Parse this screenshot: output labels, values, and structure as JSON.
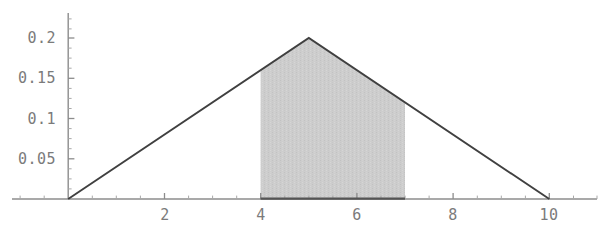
{
  "chart_data": {
    "type": "area",
    "title": "",
    "xlabel": "",
    "ylabel": "",
    "xlim": [
      -1.1,
      11.0
    ],
    "ylim": [
      0,
      0.235
    ],
    "grid": false,
    "legend": null,
    "series": [
      {
        "name": "triangular-density",
        "type": "line",
        "x": [
          0,
          5,
          10
        ],
        "values": [
          0,
          0.2,
          0
        ]
      },
      {
        "name": "shaded-region",
        "type": "area",
        "x": [
          4,
          5,
          7
        ],
        "values": [
          0.16,
          0.2,
          0.12
        ],
        "x_range": [
          4,
          7
        ],
        "fill_color": "#cdcdcd"
      }
    ],
    "x_ticks": [
      2,
      4,
      6,
      8,
      10
    ],
    "x_tick_labels": [
      "2",
      "4",
      "6",
      "8",
      "10"
    ],
    "x_minor_ticks": [
      -1,
      -0.5,
      0.5,
      1,
      1.5,
      2.5,
      3,
      3.5,
      4.5,
      5,
      5.5,
      6.5,
      7,
      7.5,
      8.5,
      9,
      9.5,
      10.5,
      11
    ],
    "y_ticks": [
      0.05,
      0.1,
      0.15,
      0.2
    ],
    "y_tick_labels": [
      "0.05",
      "0.1",
      "0.15",
      "0.2"
    ],
    "y_minor_ticks": [
      0.0125,
      0.025,
      0.0375,
      0.0625,
      0.075,
      0.0875,
      0.1125,
      0.125,
      0.1375,
      0.1625,
      0.175,
      0.1875,
      0.2125,
      0.225
    ],
    "colors": {
      "curve": "#404040",
      "axis": "#8c8c8c",
      "tick_text": "#7b7b7b",
      "fill": "#cdcdcd",
      "background": "#ffffff"
    }
  },
  "axis": {
    "y_tick_0": "0.2",
    "y_tick_1": "0.15",
    "y_tick_2": "0.1",
    "y_tick_3": "0.05",
    "x_tick_0": "2",
    "x_tick_1": "4",
    "x_tick_2": "6",
    "x_tick_3": "8",
    "x_tick_4": "10"
  }
}
